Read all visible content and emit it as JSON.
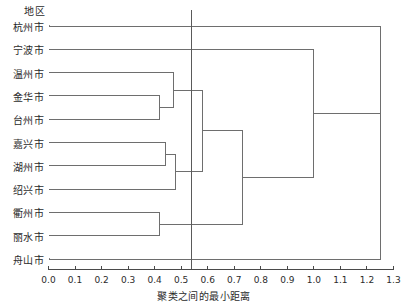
{
  "chart_data": {
    "type": "dendrogram",
    "title": "地区",
    "xlabel": "聚类之间的最小距离",
    "ylabel": "",
    "xlim": [
      0.0,
      1.3
    ],
    "grid": false,
    "legend": "none",
    "tick_labels": [
      "0.0",
      "0.1",
      "0.2",
      "0.3",
      "0.4",
      "0.5",
      "0.6",
      "0.7",
      "0.8",
      "0.9",
      "1.0",
      "1.1",
      "1.2",
      "1.3"
    ],
    "tick_values": [
      0.0,
      0.1,
      0.2,
      0.3,
      0.4,
      0.5,
      0.6,
      0.7,
      0.8,
      0.9,
      1.0,
      1.1,
      1.2,
      1.3
    ],
    "leaves": [
      {
        "label": "杭州市",
        "index": 0
      },
      {
        "label": "宁波市",
        "index": 1
      },
      {
        "label": "温州市",
        "index": 2
      },
      {
        "label": "金华市",
        "index": 3
      },
      {
        "label": "台州市",
        "index": 4
      },
      {
        "label": "嘉兴市",
        "index": 5
      },
      {
        "label": "湖州市",
        "index": 6
      },
      {
        "label": "绍兴市",
        "index": 7
      },
      {
        "label": "衢州市",
        "index": 8
      },
      {
        "label": "丽水市",
        "index": 9
      },
      {
        "label": "舟山市",
        "index": 10
      }
    ],
    "merges": [
      {
        "id": "m1",
        "left": "金华市",
        "right": "台州市",
        "distance": 0.42
      },
      {
        "id": "m2",
        "left": "温州市",
        "right": "m1",
        "distance": 0.47
      },
      {
        "id": "m3",
        "left": "嘉兴市",
        "right": "湖州市",
        "distance": 0.44
      },
      {
        "id": "m4",
        "left": "m3",
        "right": "绍兴市",
        "distance": 0.48
      },
      {
        "id": "m5",
        "left": "衢州市",
        "right": "丽水市",
        "distance": 0.42
      },
      {
        "id": "m6",
        "left": "m2",
        "right": "m4",
        "distance": 0.58
      },
      {
        "id": "m7",
        "left": "m6",
        "right": "m5",
        "distance": 0.73
      },
      {
        "id": "m8",
        "left": "宁波市",
        "right": "m7",
        "distance": 1.0
      },
      {
        "id": "m9",
        "left": "杭州市",
        "right": "m8",
        "distance": 1.25
      },
      {
        "id": "m10",
        "left": "m9",
        "right": "舟山市",
        "distance": 1.25
      }
    ],
    "cut_line": {
      "value": 0.54,
      "label": ""
    },
    "colors": {
      "line": "#6e6e6e",
      "leaf": "#8a8a8a",
      "axis": "#4a4a4a",
      "text": "#2b2b2b",
      "background": "#ffffff"
    }
  }
}
